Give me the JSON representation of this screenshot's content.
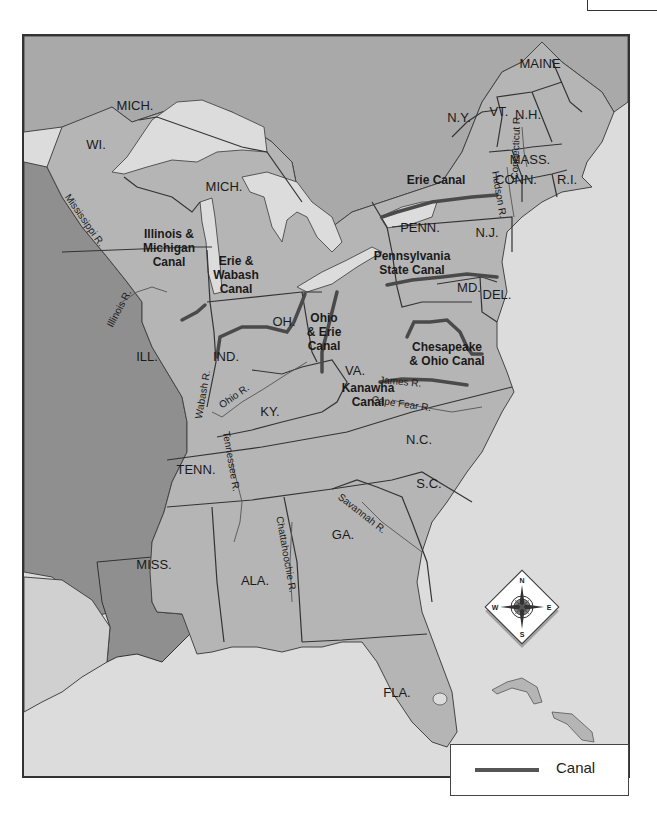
{
  "map": {
    "title": "",
    "colors": {
      "water": "#dcdcdc",
      "us_land": "#b4b4b4",
      "canada_land": "#a8a8a8",
      "west_land": "#8e8e8e",
      "border": "#333333",
      "canal": "#4a4a4a"
    },
    "states": [
      {
        "label": "MAINE",
        "x": 538,
        "y": 66
      },
      {
        "label": "N.H.",
        "x": 526,
        "y": 117
      },
      {
        "label": "VT.",
        "x": 497,
        "y": 114
      },
      {
        "label": "N.Y.",
        "x": 457,
        "y": 120
      },
      {
        "label": "MASS.",
        "x": 528,
        "y": 162
      },
      {
        "label": "CONN.",
        "x": 514,
        "y": 182
      },
      {
        "label": "R.I.",
        "x": 565,
        "y": 182
      },
      {
        "label": "N.J.",
        "x": 485,
        "y": 235
      },
      {
        "label": "PENN.",
        "x": 418,
        "y": 230
      },
      {
        "label": "DEL.",
        "x": 495,
        "y": 297
      },
      {
        "label": "MD.",
        "x": 467,
        "y": 290
      },
      {
        "label": "MICH.",
        "x": 133,
        "y": 108
      },
      {
        "label": "WI.",
        "x": 94,
        "y": 147
      },
      {
        "label": "MICH.",
        "x": 222,
        "y": 189
      },
      {
        "label": "OH.",
        "x": 282,
        "y": 324
      },
      {
        "label": "VA.",
        "x": 353,
        "y": 373
      },
      {
        "label": "IND.",
        "x": 224,
        "y": 359
      },
      {
        "label": "ILL.",
        "x": 145,
        "y": 359
      },
      {
        "label": "KY.",
        "x": 268,
        "y": 414
      },
      {
        "label": "N.C.",
        "x": 417,
        "y": 442
      },
      {
        "label": "TENN.",
        "x": 194,
        "y": 472
      },
      {
        "label": "S.C.",
        "x": 427,
        "y": 486
      },
      {
        "label": "GA.",
        "x": 341,
        "y": 537
      },
      {
        "label": "MISS.",
        "x": 152,
        "y": 567
      },
      {
        "label": "ALA.",
        "x": 253,
        "y": 583
      },
      {
        "label": "FLA.",
        "x": 395,
        "y": 695
      }
    ],
    "canals": [
      {
        "lines": [
          "Erie Canal"
        ],
        "x": 434,
        "y": 182
      },
      {
        "lines": [
          "Pennsylvania",
          "State Canal"
        ],
        "x": 410,
        "y": 258
      },
      {
        "lines": [
          "Chesapeake",
          "& Ohio Canal"
        ],
        "x": 445,
        "y": 349
      },
      {
        "lines": [
          "Kanawha",
          "Canal"
        ],
        "x": 366,
        "y": 390
      },
      {
        "lines": [
          "Ohio",
          "& Erie",
          "Canal"
        ],
        "x": 322,
        "y": 320
      },
      {
        "lines": [
          "Erie &",
          "Wabash",
          "Canal"
        ],
        "x": 234,
        "y": 263
      },
      {
        "lines": [
          "Illinois &",
          "Michigan",
          "Canal"
        ],
        "x": 167,
        "y": 236
      }
    ],
    "rivers": [
      {
        "label": "Mississippi R.",
        "x": 80,
        "y": 220,
        "rotate": 55
      },
      {
        "label": "Illinois R.",
        "x": 120,
        "y": 308,
        "rotate": -62
      },
      {
        "label": "Wabash R.",
        "x": 204,
        "y": 393,
        "rotate": -80
      },
      {
        "label": "Ohio R.",
        "x": 234,
        "y": 397,
        "rotate": -35
      },
      {
        "label": "Tennessee R.",
        "x": 226,
        "y": 460,
        "rotate": 80
      },
      {
        "label": "Chattahoochie R.",
        "x": 281,
        "y": 553,
        "rotate": 80
      },
      {
        "label": "Savannah R.",
        "x": 358,
        "y": 514,
        "rotate": 38
      },
      {
        "label": "James R.",
        "x": 398,
        "y": 383,
        "rotate": 5
      },
      {
        "label": "Cape Fear R.",
        "x": 399,
        "y": 405,
        "rotate": 8
      },
      {
        "label": "Hudson R.",
        "x": 494,
        "y": 193,
        "rotate": 80
      },
      {
        "label": "Connecticut R.",
        "x": 517,
        "y": 145,
        "rotate": -88
      }
    ],
    "compass": {
      "n": "N",
      "s": "S",
      "e": "E",
      "w": "W"
    }
  },
  "legend": {
    "items": [
      {
        "label": "Canal",
        "color": "#555555"
      }
    ]
  }
}
